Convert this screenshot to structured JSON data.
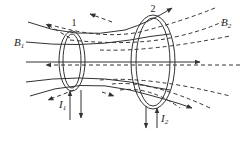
{
  "diagram": {
    "labels": {
      "loop1": "1",
      "loop2": "2",
      "field1_main": "B",
      "field1_sub": "1",
      "field2_main": "B",
      "field2_sub": "2",
      "current1_main": "I",
      "current1_sub": "1",
      "current2_main": "I",
      "current2_sub": "2"
    },
    "legend": {
      "solid_lines": "field of loop 1 (B1)",
      "dashed_lines": "field of loop 2 (B2)"
    },
    "colors": {
      "line": "#333333",
      "background": "#ffffff"
    }
  }
}
